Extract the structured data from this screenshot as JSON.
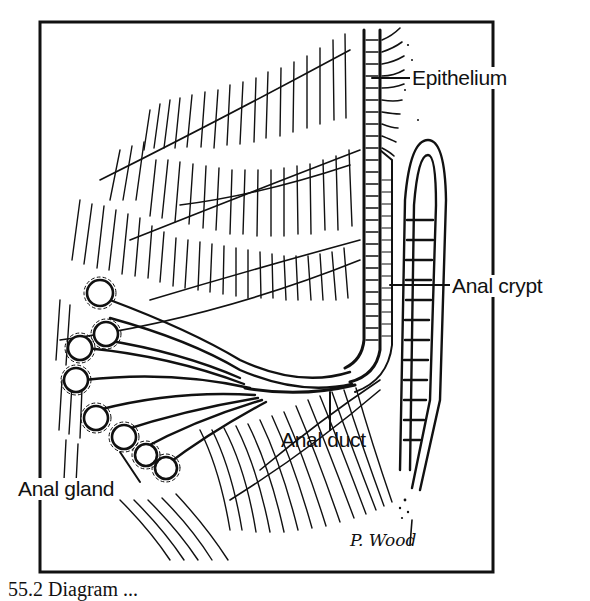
{
  "figure": {
    "type": "anatomical line drawing",
    "frame": {
      "x": 40,
      "y": 22,
      "width": 453,
      "height": 550
    },
    "labels": [
      {
        "id": "epithelium",
        "text": "Epithelium",
        "x": 411,
        "y": 65,
        "pointer_to": [
          372,
          78
        ]
      },
      {
        "id": "anal-crypt",
        "text": "Anal crypt",
        "x": 451,
        "y": 278,
        "pointer_to": [
          390,
          285
        ]
      },
      {
        "id": "anal-duct",
        "text": "Anal duct",
        "x": 281,
        "y": 430,
        "pointer_to": [
          330,
          392
        ]
      },
      {
        "id": "anal-gland",
        "text": "Anal gland",
        "x": 17,
        "y": 478,
        "pointer_to": [
          120,
          450
        ]
      }
    ],
    "signature": "P. Wood",
    "caption_partial": "55.2 Diagram ..."
  },
  "colors": {
    "ink": "#111111",
    "paper": "#ffffff"
  }
}
